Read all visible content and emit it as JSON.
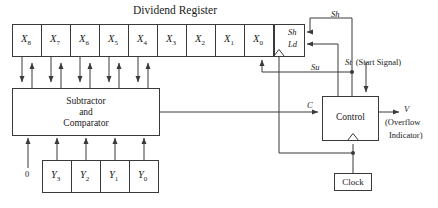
{
  "diagram": {
    "title": "Dividend Register",
    "dividend_register": {
      "name": "Dividend Register",
      "cells": [
        {
          "base": "X",
          "sub": "8"
        },
        {
          "base": "X",
          "sub": "7"
        },
        {
          "base": "X",
          "sub": "6"
        },
        {
          "base": "X",
          "sub": "5"
        },
        {
          "base": "X",
          "sub": "4"
        },
        {
          "base": "X",
          "sub": "3"
        },
        {
          "base": "X",
          "sub": "2"
        },
        {
          "base": "X",
          "sub": "1"
        },
        {
          "base": "X",
          "sub": "0"
        }
      ]
    },
    "divisor_register": {
      "cells": [
        {
          "base": "Y",
          "sub": "3"
        },
        {
          "base": "Y",
          "sub": "2"
        },
        {
          "base": "Y",
          "sub": "1"
        },
        {
          "base": "Y",
          "sub": "0"
        }
      ]
    },
    "blocks": {
      "subtractor": {
        "line1": "Subtractor",
        "line2": "and",
        "line3": "Comparator"
      },
      "control": {
        "label": "Control"
      },
      "clock": {
        "label": "Clock"
      },
      "shld": {
        "sh": "Sh",
        "ld": "Ld"
      }
    },
    "signals": {
      "sh": "Sh",
      "su": "Su",
      "c": "C",
      "v": "V",
      "v_note_line1": "(Overflow",
      "v_note_line2": "Indicator)",
      "st_italic": "St",
      "st_roman": "(Start Signal)",
      "zero": "0"
    },
    "colors": {
      "line": "#3a3a3a",
      "text": "#1a1a1a",
      "background": "#ffffff"
    }
  }
}
